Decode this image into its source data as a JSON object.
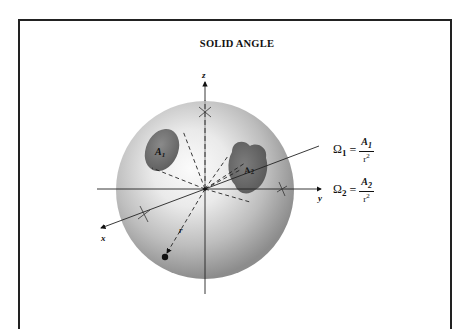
{
  "title": "SOLID ANGLE",
  "axes": {
    "x_label": "x",
    "y_label": "y",
    "z_label": "z",
    "r_label": "r"
  },
  "areas": [
    {
      "label": "A",
      "subscript": "1"
    },
    {
      "label": "A",
      "subscript": "2"
    }
  ],
  "equations": [
    {
      "lhs": "Ω",
      "lhs_sub": "1",
      "equals": "=",
      "num": "A",
      "num_sub": "1",
      "den": "r",
      "den_sup": "2"
    },
    {
      "lhs": "Ω",
      "lhs_sub": "2",
      "equals": "=",
      "num": "A",
      "num_sub": "2",
      "den": "r",
      "den_sup": "2"
    }
  ],
  "colors": {
    "frame": "#222222",
    "sphere_light": "#f4f4f4",
    "sphere_dark": "#8a8a8a",
    "patch": "#6e6e6e",
    "ink": "#111111"
  }
}
